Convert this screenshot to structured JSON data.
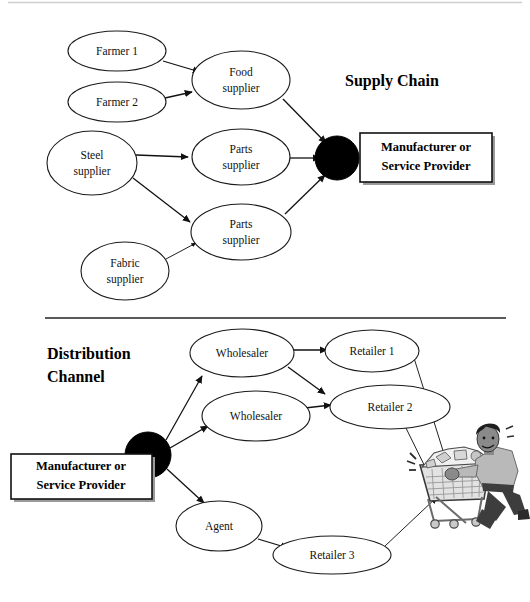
{
  "diagram": {
    "title_supply_chain": "Supply Chain",
    "title_distribution_channel_line1": "Distribution",
    "title_distribution_channel_line2": "Channel",
    "hub_label_line1": "Manufacturer or",
    "hub_label_line2": "Service Provider",
    "colors": {
      "node_fill": "#ffffff",
      "node_stroke": "#1a1a1a",
      "hub_fill": "#000000",
      "edge": "#111111",
      "divider": "#5a5a5a",
      "text": "#111111",
      "shopper_skin": "#8a8a8a",
      "shopper_shirt": "#b9b9b9",
      "shopper_pants": "#3d3d3d",
      "cart_metal": "#b0b0b0"
    },
    "supply_chain": {
      "section_name": "Supply Chain",
      "nodes": [
        {
          "id": "farmer1",
          "label": "Farmer 1",
          "lines": [
            "Farmer 1"
          ],
          "cx": 117,
          "cy": 51,
          "rx": 49,
          "ry": 20
        },
        {
          "id": "farmer2",
          "label": "Farmer 2",
          "lines": [
            "Farmer 2"
          ],
          "cx": 117,
          "cy": 102,
          "rx": 49,
          "ry": 20
        },
        {
          "id": "steel_supplier",
          "label": "Steel supplier",
          "lines": [
            "Steel",
            "supplier"
          ],
          "cx": 92,
          "cy": 163,
          "rx": 45,
          "ry": 32
        },
        {
          "id": "fabric_supplier",
          "label": "Fabric supplier",
          "lines": [
            "Fabric",
            "supplier"
          ],
          "cx": 125,
          "cy": 271,
          "rx": 44,
          "ry": 29
        },
        {
          "id": "food_supplier",
          "label": "Food supplier",
          "lines": [
            "Food",
            "supplier"
          ],
          "cx": 241,
          "cy": 80,
          "rx": 49,
          "ry": 29
        },
        {
          "id": "parts_supplier_1",
          "label": "Parts supplier",
          "lines": [
            "Parts",
            "supplier"
          ],
          "cx": 241,
          "cy": 157,
          "rx": 49,
          "ry": 28
        },
        {
          "id": "parts_supplier_2",
          "label": "Parts supplier",
          "lines": [
            "Parts",
            "supplier"
          ],
          "cx": 241,
          "cy": 232,
          "rx": 50,
          "ry": 28
        }
      ],
      "hub": {
        "id": "manufacturer_supply",
        "cx": 337,
        "cy": 158,
        "r": 22,
        "box_x": 360,
        "box_y": 133,
        "box_w": 132,
        "box_h": 49
      },
      "edges": [
        {
          "from": "farmer1",
          "to": "food_supplier"
        },
        {
          "from": "farmer2",
          "to": "food_supplier"
        },
        {
          "from": "steel_supplier",
          "to": "parts_supplier_1"
        },
        {
          "from": "steel_supplier",
          "to": "parts_supplier_2"
        },
        {
          "from": "fabric_supplier",
          "to": "parts_supplier_2"
        },
        {
          "from": "food_supplier",
          "to": "manufacturer_supply"
        },
        {
          "from": "parts_supplier_1",
          "to": "manufacturer_supply"
        },
        {
          "from": "parts_supplier_2",
          "to": "manufacturer_supply"
        }
      ]
    },
    "distribution_channel": {
      "section_name": "Distribution Channel",
      "nodes": [
        {
          "id": "wholesaler1",
          "label": "Wholesaler",
          "lines": [
            "Wholesaler"
          ],
          "cx": 242,
          "cy": 353,
          "rx": 52,
          "ry": 24
        },
        {
          "id": "wholesaler2",
          "label": "Wholesaler",
          "lines": [
            "Wholesaler"
          ],
          "cx": 256,
          "cy": 416,
          "rx": 54,
          "ry": 25
        },
        {
          "id": "retailer1",
          "label": "Retailer 1",
          "lines": [
            "Retailer 1"
          ],
          "cx": 372,
          "cy": 351,
          "rx": 47,
          "ry": 21
        },
        {
          "id": "retailer2",
          "label": "Retailer 2",
          "lines": [
            "Retailer 2"
          ],
          "cx": 390,
          "cy": 407,
          "rx": 60,
          "ry": 22
        },
        {
          "id": "agent",
          "label": "Agent",
          "lines": [
            "Agent"
          ],
          "cx": 219,
          "cy": 526,
          "rx": 43,
          "ry": 25
        },
        {
          "id": "retailer3",
          "label": "Retailer 3",
          "lines": [
            "Retailer 3"
          ],
          "cx": 332,
          "cy": 555,
          "rx": 59,
          "ry": 19
        }
      ],
      "hub": {
        "id": "manufacturer_distribution",
        "cx": 148,
        "cy": 455,
        "r": 23,
        "box_x": 11,
        "box_y": 454,
        "box_w": 141,
        "box_h": 45
      },
      "consumer": {
        "id": "shopper-with-cart",
        "label": "shopper-with-shopping-cart",
        "x": 414,
        "y": 425,
        "w": 112,
        "h": 100
      },
      "edges": [
        {
          "from": "manufacturer_distribution",
          "to": "wholesaler1"
        },
        {
          "from": "manufacturer_distribution",
          "to": "wholesaler2"
        },
        {
          "from": "manufacturer_distribution",
          "to": "agent"
        },
        {
          "from": "wholesaler1",
          "to": "retailer1"
        },
        {
          "from": "wholesaler1",
          "to": "retailer2"
        },
        {
          "from": "wholesaler2",
          "to": "retailer2"
        },
        {
          "from": "agent",
          "to": "retailer3"
        },
        {
          "from": "retailer1",
          "to": "shopper-with-cart"
        },
        {
          "from": "retailer2",
          "to": "shopper-with-cart"
        },
        {
          "from": "retailer3",
          "to": "shopper-with-cart"
        }
      ]
    }
  }
}
